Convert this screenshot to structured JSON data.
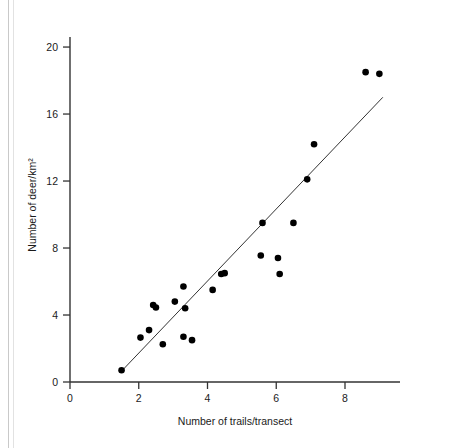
{
  "figure": {
    "background_color": "#ffffff",
    "ink_color": "#000000",
    "axis_color": "#333333"
  },
  "chart_data": {
    "type": "scatter",
    "title": "",
    "xlabel": "Number of trails/transect",
    "ylabel": "Number of deer/km²",
    "xlim": [
      0,
      9.6
    ],
    "ylim": [
      0,
      20.6
    ],
    "xticks": [
      0,
      2,
      4,
      6,
      8
    ],
    "xtick_labels": [
      "0",
      "2",
      "4",
      "6",
      "8"
    ],
    "yticks": [
      0,
      4,
      8,
      12,
      16,
      20
    ],
    "ytick_labels": [
      "0",
      "4",
      "8",
      "12",
      "16",
      "20"
    ],
    "grid": false,
    "legend": null,
    "marker": {
      "shape": "circle",
      "color": "#000000",
      "size": 4.6
    },
    "points": [
      {
        "x": 1.5,
        "y": 0.7
      },
      {
        "x": 2.05,
        "y": 2.65
      },
      {
        "x": 2.3,
        "y": 3.1
      },
      {
        "x": 2.42,
        "y": 4.6
      },
      {
        "x": 2.5,
        "y": 4.45
      },
      {
        "x": 2.7,
        "y": 2.25
      },
      {
        "x": 3.05,
        "y": 4.8
      },
      {
        "x": 3.3,
        "y": 5.7
      },
      {
        "x": 3.3,
        "y": 2.7
      },
      {
        "x": 3.35,
        "y": 4.4
      },
      {
        "x": 3.55,
        "y": 2.5
      },
      {
        "x": 4.15,
        "y": 5.5
      },
      {
        "x": 4.4,
        "y": 6.45
      },
      {
        "x": 4.5,
        "y": 6.5
      },
      {
        "x": 5.55,
        "y": 7.55
      },
      {
        "x": 5.6,
        "y": 9.5
      },
      {
        "x": 6.05,
        "y": 7.4
      },
      {
        "x": 6.1,
        "y": 6.45
      },
      {
        "x": 6.5,
        "y": 9.5
      },
      {
        "x": 6.9,
        "y": 12.1
      },
      {
        "x": 7.1,
        "y": 14.2
      },
      {
        "x": 8.6,
        "y": 18.5
      },
      {
        "x": 9.0,
        "y": 18.4
      }
    ],
    "trendline": {
      "type": "linear-fit",
      "x_start": 1.5,
      "y_start": 0.65,
      "x_end": 9.1,
      "y_end": 17.0,
      "color": "#333333",
      "width": 1
    }
  }
}
